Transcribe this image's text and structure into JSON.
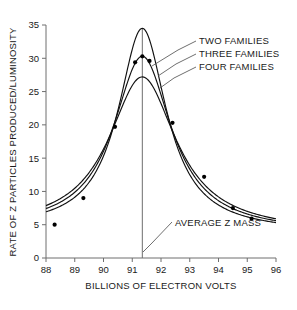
{
  "chart_data": {
    "type": "line",
    "title": "",
    "xlabel": "BILLIONS OF ELECTRON VOLTS",
    "ylabel": "RATE OF Z PARTICLES PRODUCED/LUMINOSITY",
    "xlim": [
      88,
      96
    ],
    "ylim": [
      0,
      35
    ],
    "xticks": [
      88,
      89,
      90,
      91,
      92,
      93,
      94,
      95,
      96
    ],
    "xtick_labels": [
      "88",
      "89",
      "90",
      "91",
      "92",
      "93",
      "94",
      "95",
      "96"
    ],
    "yticks": [
      0,
      5,
      10,
      15,
      20,
      25,
      30,
      35
    ],
    "ytick_labels": [
      "0",
      "5",
      "10",
      "15",
      "20",
      "25",
      "30",
      "35"
    ],
    "grid": false,
    "legend_position": "inside-upper-right",
    "series": [
      {
        "name": "TWO FAMILIES",
        "peak_x": 91.35,
        "peak_y": 34.5,
        "width_gev": 2.05,
        "x": [
          88.0,
          88.5,
          89.0,
          89.5,
          90.0,
          90.5,
          91.0,
          91.35,
          91.7,
          92.0,
          92.5,
          93.0,
          93.5,
          94.0,
          94.5,
          95.0,
          95.5,
          96.0
        ],
        "values": [
          4.2,
          5.3,
          7.1,
          10.0,
          14.7,
          22.2,
          31.9,
          34.5,
          31.6,
          26.8,
          17.8,
          12.2,
          9.0,
          7.1,
          5.9,
          5.2,
          4.8,
          4.6
        ]
      },
      {
        "name": "THREE FAMILIES",
        "peak_x": 91.35,
        "peak_y": 30.3,
        "width_gev": 2.45,
        "x": [
          88.0,
          88.5,
          89.0,
          89.5,
          90.0,
          90.5,
          91.0,
          91.35,
          91.7,
          92.0,
          92.5,
          93.0,
          93.5,
          94.0,
          94.5,
          95.0,
          95.5,
          96.0
        ],
        "values": [
          4.2,
          5.2,
          7.0,
          9.8,
          14.4,
          21.3,
          28.7,
          30.3,
          28.5,
          25.0,
          17.6,
          12.4,
          9.3,
          7.3,
          6.1,
          5.3,
          4.9,
          4.6
        ]
      },
      {
        "name": "FOUR FAMILIES",
        "peak_x": 91.35,
        "peak_y": 27.2,
        "width_gev": 2.85,
        "x": [
          88.0,
          88.5,
          89.0,
          89.5,
          90.0,
          90.5,
          91.0,
          91.35,
          91.7,
          92.0,
          92.5,
          93.0,
          93.5,
          94.0,
          94.5,
          95.0,
          95.5,
          96.0
        ],
        "values": [
          4.2,
          5.2,
          6.9,
          9.6,
          13.9,
          20.1,
          26.0,
          27.2,
          25.9,
          23.2,
          17.2,
          12.5,
          9.5,
          7.5,
          6.3,
          5.4,
          5.0,
          4.7
        ]
      }
    ],
    "data_points": [
      {
        "x": 88.3,
        "y": 5.0
      },
      {
        "x": 89.3,
        "y": 9.0
      },
      {
        "x": 90.4,
        "y": 19.7
      },
      {
        "x": 91.1,
        "y": 29.4
      },
      {
        "x": 91.35,
        "y": 30.3
      },
      {
        "x": 91.6,
        "y": 29.6
      },
      {
        "x": 92.4,
        "y": 20.3
      },
      {
        "x": 93.5,
        "y": 12.2
      },
      {
        "x": 94.5,
        "y": 7.5
      },
      {
        "x": 95.15,
        "y": 5.9
      }
    ],
    "annotations": [
      {
        "label": "AVERAGE Z MASS",
        "x": 91.35,
        "type": "vertical-line"
      }
    ]
  },
  "axes": {
    "y_axis_title": "RATE OF Z PARTICLES PRODUCED/LUMINOSITY",
    "x_axis_title": "BILLIONS OF ELECTRON VOLTS"
  },
  "labels": {
    "series_two": "TWO FAMILIES",
    "series_three": "THREE FAMILIES",
    "series_four": "FOUR FAMILIES",
    "average_z_mass": "AVERAGE Z MASS"
  },
  "ticks": {
    "x": [
      "88",
      "89",
      "90",
      "91",
      "92",
      "93",
      "94",
      "95",
      "96"
    ],
    "y": [
      "0",
      "5",
      "10",
      "15",
      "20",
      "25",
      "30",
      "35"
    ]
  },
  "colors": {
    "curve": "#111111",
    "axis": "#6e6e6e",
    "text": "#1a1a1a",
    "background": "#ffffff",
    "datapoint": "#000000"
  }
}
